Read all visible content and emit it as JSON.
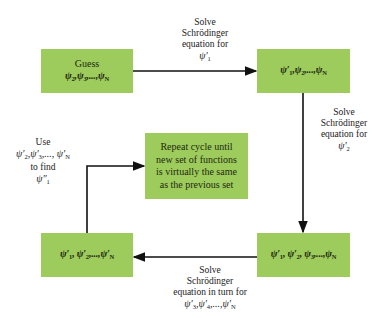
{
  "diagram": {
    "colors": {
      "box_fill": "#9dcb5c",
      "arrow": "#111111",
      "text": "#222222"
    },
    "boxes": {
      "guess": {
        "line1": "Guess",
        "line2": "ψ₂,ψ₃,...,ψN"
      },
      "top_right": {
        "text": "ψ′₁,ψ₂,...,ψN"
      },
      "bottom_right": {
        "text": "ψ′₁, ψ′₂, ψ₃,...,ψN"
      },
      "bottom_left": {
        "text": "ψ′₁, ψ′₂,...,ψ′N"
      },
      "center": {
        "lines": [
          "Repeat cycle until",
          "new set of functions",
          "is virtually the same",
          "as the previous set"
        ]
      }
    },
    "labels": {
      "top": {
        "lines": [
          "Solve",
          "Schrödinger",
          "equation for",
          "ψ′₁"
        ]
      },
      "right": {
        "lines": [
          "Solve",
          "Schrödinger",
          "equation for",
          "ψ′₂"
        ]
      },
      "bottom": {
        "lines": [
          "Solve",
          "Schrödinger",
          "equation in turn for",
          "ψ′₃,ψ′₄,...,ψ′N"
        ]
      },
      "left": {
        "lines": [
          "Use",
          "ψ′₂,ψ′₃,..., ψ′N",
          "to find",
          "ψ″₁"
        ]
      }
    }
  }
}
